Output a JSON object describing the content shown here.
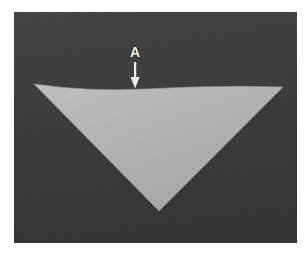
{
  "figure": {
    "caption_label": "A",
    "canvas": {
      "width": 306,
      "height": 257,
      "background": "#ffffff"
    },
    "panel": {
      "left": 14,
      "top": 12,
      "width": 283,
      "height": 231,
      "substrate_color": "#3b3b3b",
      "substrate_color_light": "#464646",
      "substrate_color_dark": "#303030"
    },
    "feature": {
      "name": "inverted-triangular-feature",
      "fill_color": "#b4b4b4",
      "fill_color_light": "#c2c2c2",
      "fill_color_dark": "#a6a6a6",
      "edge_color": "#8e8e8e",
      "vertices_panel_coords": [
        {
          "label": "left-vertex",
          "x": 20,
          "y": 72
        },
        {
          "label": "surface-dip",
          "x": 131,
          "y": 77
        },
        {
          "label": "right-vertex",
          "x": 269,
          "y": 75
        },
        {
          "label": "bottom-apex",
          "x": 145,
          "y": 199
        }
      ],
      "top_edge_profile": "shallow concave dip at center"
    },
    "annotation": {
      "label_text": "A",
      "label_color": "#f2f2f2",
      "label_position_panel_coords": {
        "x": 121,
        "y": 40
      },
      "arrow": {
        "name": "down-arrow",
        "color": "#f2f2f2",
        "direction": "down",
        "shaft_x": 121,
        "shaft_top_y": 50,
        "shaft_bottom_y": 66,
        "shaft_width": 2,
        "head_half_width": 4.5,
        "head_tip_y": 76,
        "points_at": "surface-dip"
      }
    }
  }
}
